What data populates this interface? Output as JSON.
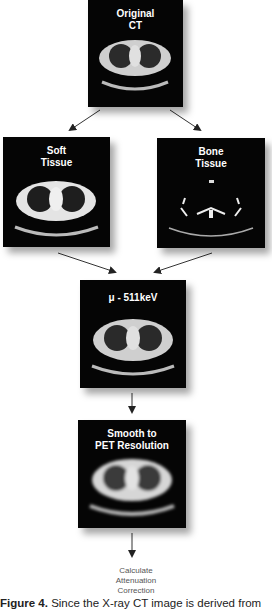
{
  "diagram": {
    "nodes": [
      {
        "id": "original",
        "label": "Original\nCT",
        "type": "ct-image"
      },
      {
        "id": "soft",
        "label": "Soft\nTissue",
        "type": "ct-image-segmented"
      },
      {
        "id": "bone",
        "label": "Bone\nTissue",
        "type": "ct-image-segmented"
      },
      {
        "id": "mu",
        "label": "μ - 511keV",
        "type": "ct-image"
      },
      {
        "id": "smooth",
        "label": "Smooth to\nPET Resolution",
        "type": "ct-image-blurred"
      },
      {
        "id": "final",
        "label": "Calculate\nAttenuation\nCorrection",
        "type": "text"
      }
    ],
    "edges": [
      {
        "from": "original",
        "to": "soft"
      },
      {
        "from": "original",
        "to": "bone"
      },
      {
        "from": "soft",
        "to": "mu"
      },
      {
        "from": "bone",
        "to": "mu"
      },
      {
        "from": "mu",
        "to": "smooth"
      },
      {
        "from": "smooth",
        "to": "final"
      }
    ]
  },
  "caption": {
    "label": "Figure 4.",
    "text": " Since the X-ray CT image is derived from"
  }
}
